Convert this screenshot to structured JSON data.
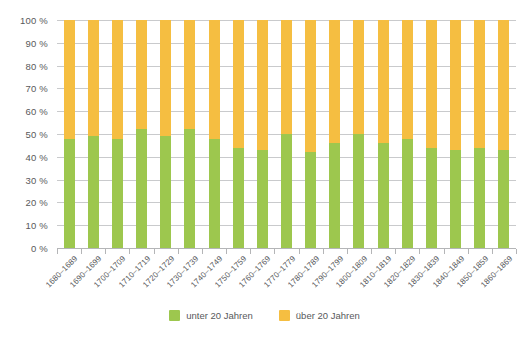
{
  "chart_data": {
    "type": "bar",
    "subtype": "stacked-100-percent",
    "title": "",
    "xlabel": "",
    "ylabel": "",
    "ylim": [
      0,
      100
    ],
    "y_unit": "%",
    "grid": true,
    "legend_position": "bottom",
    "categories": [
      "1680–1689",
      "1690–1699",
      "1700–1709",
      "1710–1719",
      "1720–1729",
      "1730–1739",
      "1740–1749",
      "1750–1759",
      "1760–1769",
      "1770–1779",
      "1780–1789",
      "1790–1799",
      "1800–1809",
      "1810–1819",
      "1820–1829",
      "1830–1839",
      "1840–1849",
      "1850–1859",
      "1860–1869"
    ],
    "y_ticks": [
      "0 %",
      "10 %",
      "20 %",
      "30 %",
      "40 %",
      "50 %",
      "60 %",
      "70 %",
      "80 %",
      "90 %",
      "100 %"
    ],
    "y_tick_values": [
      0,
      10,
      20,
      30,
      40,
      50,
      60,
      70,
      80,
      90,
      100
    ],
    "series": [
      {
        "name": "unter 20 Jahren",
        "color": "#9dc74e",
        "values": [
          48,
          49,
          48,
          52,
          49,
          52,
          48,
          44,
          43,
          50,
          42,
          46,
          50,
          46,
          48,
          44,
          43,
          44,
          43
        ]
      },
      {
        "name": "über 20 Jahren",
        "color": "#f5be41",
        "values": [
          52,
          51,
          52,
          48,
          51,
          48,
          52,
          56,
          57,
          50,
          58,
          54,
          50,
          54,
          52,
          56,
          57,
          56,
          57
        ]
      }
    ]
  },
  "legend": {
    "items": [
      {
        "label": "unter 20 Jahren",
        "color": "#9dc74e"
      },
      {
        "label": "über 20 Jahren",
        "color": "#f5be41"
      }
    ]
  },
  "colors": {
    "under_20": "#9dc74e",
    "over_20": "#f5be41",
    "gridline": "#c9cacc",
    "axis": "#b4b5b7",
    "text": "#58595b",
    "background": "#ffffff"
  }
}
